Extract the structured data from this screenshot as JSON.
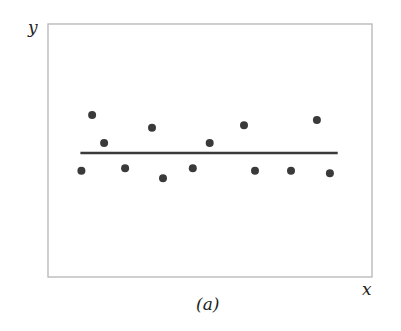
{
  "figure": {
    "caption": "(a)",
    "x_label": "x",
    "y_label": "y"
  },
  "colors": {
    "frame": "#b5b5b5",
    "points": "#3a3a3a",
    "line": "#3a3a3a",
    "background": "#ffffff"
  },
  "chart_data": {
    "type": "scatter",
    "title": "",
    "subtitle": "(a)",
    "xlabel": "x",
    "ylabel": "y",
    "grid": false,
    "legend": null,
    "axis_ticks": "none (unlabeled axes)",
    "xlim": [
      0,
      10
    ],
    "ylim": [
      0,
      10
    ],
    "points": [
      {
        "x": 1.03,
        "y": 4.2
      },
      {
        "x": 1.36,
        "y": 6.4
      },
      {
        "x": 1.73,
        "y": 5.3
      },
      {
        "x": 2.38,
        "y": 4.3
      },
      {
        "x": 3.21,
        "y": 5.9
      },
      {
        "x": 3.55,
        "y": 3.9
      },
      {
        "x": 4.47,
        "y": 4.3
      },
      {
        "x": 4.99,
        "y": 5.3
      },
      {
        "x": 6.05,
        "y": 6.0
      },
      {
        "x": 6.39,
        "y": 4.2
      },
      {
        "x": 7.5,
        "y": 4.2
      },
      {
        "x": 8.3,
        "y": 6.2
      },
      {
        "x": 8.7,
        "y": 4.1
      }
    ],
    "fit_line": {
      "type": "horizontal",
      "y": 4.9,
      "x_start": 1.0,
      "x_end": 8.94,
      "description": "Horizontal regression line (zero slope) through the mean of y"
    },
    "annotations": [
      "(a)"
    ]
  }
}
